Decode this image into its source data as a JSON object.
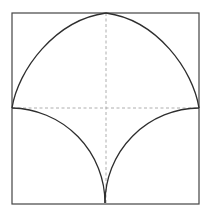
{
  "diagram": {
    "colors": {
      "background": "#ffffff",
      "frame": "#444444",
      "curve": "#2e2e2e",
      "guide": "#9a9a9a"
    },
    "square": {
      "x": 12,
      "y": 13,
      "width": 187,
      "height": 191
    },
    "key_points": {
      "apex_top": [
        106,
        13
      ],
      "left_mid": [
        12,
        108
      ],
      "right_mid": [
        199,
        108
      ],
      "cusp_bottom": [
        105,
        203
      ],
      "center": [
        106,
        108
      ]
    },
    "guides": {
      "horizontal": {
        "from": [
          12,
          108
        ],
        "to": [
          199,
          108
        ],
        "style": "dashed"
      },
      "vertical": {
        "from": [
          106,
          13
        ],
        "to": [
          106,
          203
        ],
        "style": "dashed"
      }
    },
    "arcs": {
      "upper_left": "M12,108 C18,70 55,20 106,13",
      "upper_right": "M106,13 C157,20 193,70 199,108",
      "lower_left": "M12,108 A95,95 0 0 1 105,203",
      "lower_right": "M105,203 A95,95 0 0 1 199,108"
    }
  }
}
